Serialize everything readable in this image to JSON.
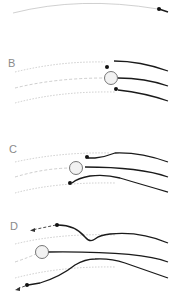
{
  "colors": {
    "guide_line": "#b8b8b8",
    "trajectory": "#1a1a1a",
    "label": "#8a8a8a",
    "sphere_fill": "#f2f2f2",
    "sphere_stroke": "#555555"
  },
  "panels": [
    {
      "id": "A",
      "label": "",
      "description": "single guide arc with particle at right end"
    },
    {
      "id": "B",
      "label": "B",
      "description": "three trajectories converging on sphere, ending in dots"
    },
    {
      "id": "C",
      "label": "C",
      "description": "sphere shifted left, outer trajectories deflect around it"
    },
    {
      "id": "D",
      "label": "D",
      "description": "outer trajectories pass the sphere and continue with dashed arrows"
    }
  ]
}
